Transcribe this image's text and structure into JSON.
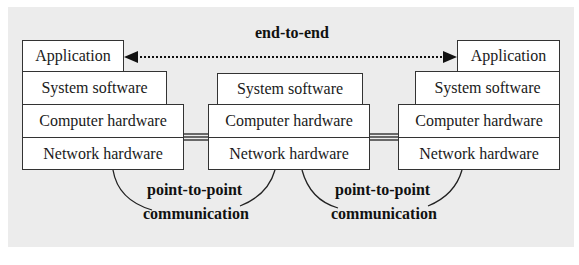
{
  "diagram": {
    "type": "network-layer-model",
    "background_color": "#ececec",
    "end_to_end_label": "end-to-end",
    "stacks": [
      {
        "id": "left",
        "layers": [
          "Application",
          "System software",
          "Computer hardware",
          "Network hardware"
        ]
      },
      {
        "id": "middle",
        "layers": [
          "System software",
          "Computer hardware",
          "Network hardware"
        ]
      },
      {
        "id": "right",
        "layers": [
          "Application",
          "System software",
          "Computer hardware",
          "Network hardware"
        ]
      }
    ],
    "links": [
      {
        "from": "left",
        "to": "middle",
        "label_line1": "point-to-point",
        "label_line2": "communication"
      },
      {
        "from": "middle",
        "to": "right",
        "label_line1": "point-to-point",
        "label_line2": "communication"
      }
    ]
  }
}
